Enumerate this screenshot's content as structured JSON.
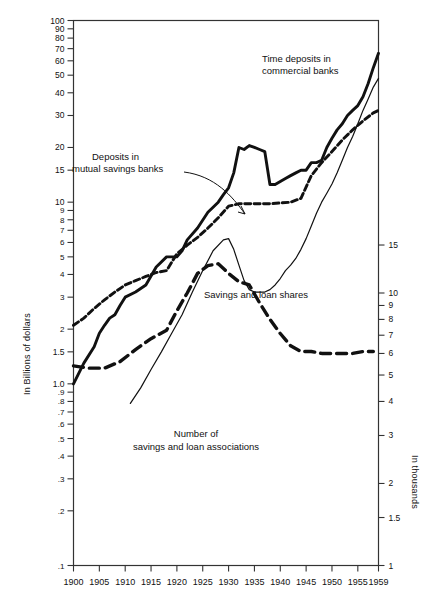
{
  "figure": {
    "background": "#ffffff",
    "ink": "#111111"
  },
  "axes": {
    "left": {
      "title": "In Billions of dollars",
      "scale": "log",
      "range": [
        0.1,
        100
      ],
      "ticks": [
        "100",
        "90",
        "80",
        "70",
        "60",
        "50",
        "40",
        "30",
        "20",
        "15",
        "10",
        "9",
        "8",
        "7",
        "6",
        "5",
        "4",
        "3",
        "2",
        "1.5",
        "1.0",
        ".9",
        ".8",
        ".7",
        ".6",
        ".5",
        ".4",
        ".3",
        ".2",
        ".1"
      ],
      "tick_values": [
        100,
        90,
        80,
        70,
        60,
        50,
        40,
        30,
        20,
        15,
        10,
        9,
        8,
        7,
        6,
        5,
        4,
        3,
        2,
        1.5,
        1.0,
        0.9,
        0.8,
        0.7,
        0.6,
        0.5,
        0.4,
        0.3,
        0.2,
        0.1
      ]
    },
    "right": {
      "title": "In thousands",
      "scale": "log",
      "range": [
        1,
        100
      ],
      "ticks": [
        "15",
        "10",
        "9",
        "8",
        "7",
        "6",
        "5",
        "4",
        "3",
        "2",
        "1.5",
        "1"
      ],
      "tick_values": [
        15,
        10,
        9,
        8,
        7,
        6,
        5,
        4,
        3,
        2,
        1.5,
        1
      ]
    },
    "bottom": {
      "ticks": [
        "1900",
        "1905",
        "1910",
        "1915",
        "1920",
        "1925",
        "1930",
        "1935",
        "1940",
        "1945",
        "1950",
        "1955",
        "1959"
      ],
      "tick_values": [
        1900,
        1905,
        1910,
        1915,
        1920,
        1925,
        1930,
        1935,
        1940,
        1945,
        1950,
        1955,
        1959
      ],
      "range": [
        1900,
        1959
      ]
    }
  },
  "annotations": {
    "time_deposits": {
      "line1": "Time deposits in",
      "line2": "commercial banks"
    },
    "mutual_savings": {
      "line1": "Deposits in",
      "line2": "mutual savings banks"
    },
    "savings_loan_shares": {
      "text": "Savings and loan shares"
    },
    "number_assoc": {
      "line1": "Number of",
      "line2": "savings and loan associations"
    }
  },
  "chart_data": {
    "type": "line",
    "title": "",
    "xlabel": "",
    "ylabel": "In Billions of dollars",
    "y2label": "In thousands",
    "xlim": [
      1900,
      1959
    ],
    "ylim": [
      0.1,
      100
    ],
    "y2lim": [
      1,
      100
    ],
    "yscale": "log",
    "grid": false,
    "legend": "inline-annotations",
    "series": [
      {
        "name": "Time deposits in commercial banks",
        "style": "thick-solid",
        "axis": "left",
        "units": "billions of dollars",
        "x": [
          1900,
          1902,
          1904,
          1905,
          1906,
          1907,
          1908,
          1909,
          1910,
          1912,
          1914,
          1916,
          1918,
          1920,
          1921,
          1922,
          1924,
          1926,
          1928,
          1929,
          1930,
          1931,
          1932,
          1933,
          1934,
          1935,
          1936,
          1937,
          1938,
          1939,
          1940,
          1941,
          1942,
          1943,
          1944,
          1945,
          1946,
          1947,
          1948,
          1949,
          1950,
          1951,
          1952,
          1953,
          1954,
          1955,
          1956,
          1957,
          1958,
          1959
        ],
        "y": [
          1.0,
          1.3,
          1.6,
          1.9,
          2.1,
          2.3,
          2.4,
          2.7,
          3.0,
          3.2,
          3.5,
          4.4,
          5.0,
          5.0,
          5.4,
          6.2,
          7.2,
          8.8,
          10.0,
          11.0,
          12.0,
          14.5,
          20.0,
          19.5,
          20.5,
          20.0,
          19.5,
          19.0,
          12.5,
          12.5,
          13.0,
          13.5,
          14.0,
          14.5,
          15.0,
          15.0,
          16.5,
          16.5,
          17.0,
          20.0,
          22.5,
          25.0,
          27.0,
          30.0,
          32.0,
          34.0,
          38.0,
          45.0,
          55.0,
          66.0
        ]
      },
      {
        "name": "Deposits in mutual savings banks",
        "style": "dashed-medium",
        "axis": "left",
        "units": "billions of dollars",
        "x": [
          1900,
          1902,
          1904,
          1906,
          1908,
          1910,
          1912,
          1914,
          1916,
          1918,
          1920,
          1922,
          1924,
          1926,
          1928,
          1930,
          1932,
          1934,
          1936,
          1938,
          1940,
          1942,
          1944,
          1946,
          1948,
          1950,
          1952,
          1954,
          1956,
          1958,
          1959
        ],
        "y": [
          2.1,
          2.3,
          2.6,
          2.9,
          3.2,
          3.5,
          3.7,
          3.9,
          4.1,
          4.2,
          5.2,
          5.8,
          6.4,
          7.2,
          8.2,
          9.5,
          9.8,
          9.8,
          9.8,
          9.8,
          9.9,
          10.0,
          10.5,
          14.0,
          16.5,
          19.0,
          22.0,
          25.0,
          28.0,
          31.0,
          32.0
        ]
      },
      {
        "name": "Savings and loan shares",
        "style": "thin-solid",
        "axis": "left",
        "units": "billions of dollars",
        "x": [
          1911,
          1913,
          1915,
          1917,
          1919,
          1921,
          1923,
          1925,
          1927,
          1929,
          1930,
          1931,
          1932,
          1933,
          1934,
          1935,
          1936,
          1937,
          1938,
          1939,
          1940,
          1941,
          1942,
          1943,
          1944,
          1945,
          1946,
          1947,
          1948,
          1949,
          1950,
          1951,
          1952,
          1953,
          1954,
          1955,
          1956,
          1957,
          1958,
          1959
        ],
        "y": [
          0.78,
          0.95,
          1.2,
          1.5,
          1.9,
          2.4,
          3.2,
          4.2,
          5.4,
          6.2,
          6.3,
          5.5,
          4.5,
          3.7,
          3.3,
          3.2,
          3.2,
          3.2,
          3.3,
          3.5,
          3.8,
          4.2,
          4.5,
          4.9,
          5.5,
          6.3,
          7.4,
          8.7,
          10.0,
          11.2,
          12.6,
          14.5,
          17.0,
          20.0,
          23.0,
          27.0,
          32.0,
          37.0,
          43.0,
          48.0
        ]
      },
      {
        "name": "Number of savings and loan associations",
        "style": "thick-dashed",
        "axis": "right",
        "units": "thousands",
        "x": [
          1900,
          1903,
          1906,
          1909,
          1912,
          1915,
          1918,
          1920,
          1922,
          1924,
          1926,
          1928,
          1929,
          1930,
          1932,
          1934,
          1936,
          1938,
          1940,
          1942,
          1944,
          1946,
          1948,
          1950,
          1952,
          1954,
          1956,
          1958
        ],
        "y": [
          5.4,
          5.3,
          5.3,
          5.6,
          6.2,
          6.8,
          7.3,
          8.6,
          10.0,
          11.8,
          12.6,
          12.8,
          12.3,
          11.8,
          11.0,
          10.7,
          9.2,
          8.0,
          7.1,
          6.4,
          6.1,
          6.1,
          6.0,
          6.0,
          6.0,
          6.0,
          6.1,
          6.1
        ]
      }
    ]
  }
}
